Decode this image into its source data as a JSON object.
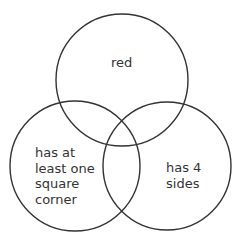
{
  "diagram": {
    "type": "venn",
    "stroke_color": "#333333",
    "background": "#ffffff",
    "sets": [
      {
        "id": "top",
        "label_lines": [
          "red"
        ],
        "cx": 122,
        "cy": 80,
        "r": 66
      },
      {
        "id": "left",
        "label_lines": [
          "has at",
          "least one",
          "square",
          "corner"
        ],
        "cx": 75,
        "cy": 166,
        "r": 65
      },
      {
        "id": "right",
        "label_lines": [
          "has 4",
          "sides"
        ],
        "cx": 167,
        "cy": 166,
        "r": 64
      }
    ]
  }
}
